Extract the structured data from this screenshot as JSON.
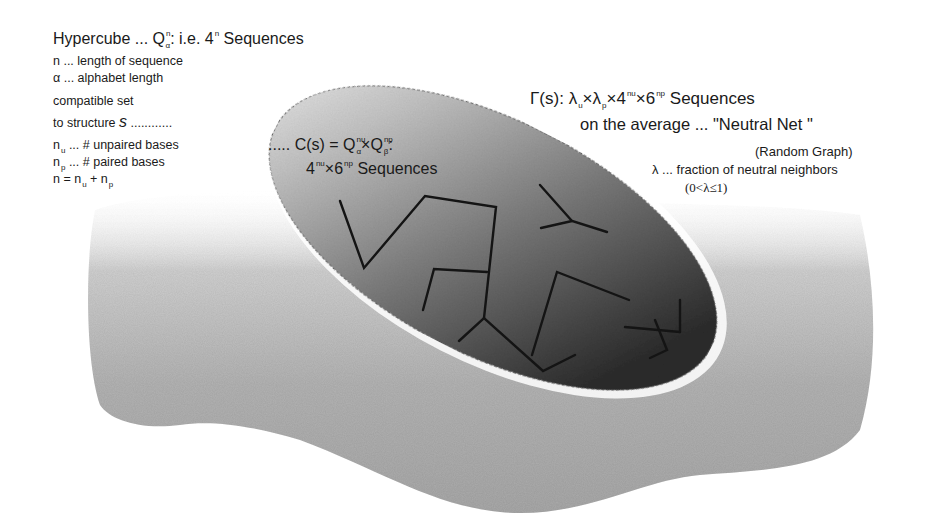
{
  "diagram": {
    "hypercube": {
      "prefix": "Hypercube ... Q",
      "q_sup": "n",
      "q_sub": "α",
      "suffix": ": i.e. 4",
      "four_sup": "n",
      "tail": " Sequences"
    },
    "definitions": [
      {
        "text": "n ... length of sequence"
      },
      {
        "text": "α ... alphabet length"
      }
    ],
    "compatible_set": {
      "line1": "compatible set",
      "line2_prefix": "to structure ",
      "line2_var": "s",
      "line2_dots": " ............"
    },
    "base_definitions": {
      "unpaired": {
        "n": "n",
        "sub": "u",
        "text": " ... # unpaired bases"
      },
      "paired": {
        "n": "n",
        "sub": "p",
        "text": " ... # paired bases"
      },
      "sum": {
        "lhs": "n = n",
        "sub1": "u",
        "plus": " + n",
        "sub2": "p"
      }
    },
    "cs_label": {
      "prefix": "..... C(s) = Q",
      "sup1": "nu",
      "sub1": "α",
      "times": "×Q",
      "sup2": "np",
      "sub2": "β",
      "colon": ":",
      "line2_four": "4",
      "line2_sup1": "nu",
      "line2_times": "×6",
      "line2_sup2": "np",
      "line2_tail": " Sequences"
    },
    "gamma_label": {
      "prefix": "Γ(s): λ",
      "sub1": "u",
      "times1": "×λ",
      "sub2": "p",
      "times2": "×4",
      "sup1": "nu",
      "times3": "×6",
      "sup2": "np",
      "tail": " Sequences",
      "line2": "on the average ... \"Neutral Net \"",
      "line3": "(Random Graph)",
      "line4": "λ ... fraction of neutral neighbors",
      "line5": "(0<λ≤1)"
    },
    "colors": {
      "blob": "#b5b5b5",
      "ellipse_light": "#d8d8d8",
      "ellipse_dark": "#3a3a3a",
      "edges": "#141414"
    },
    "graph_edges": [
      [
        [
          340,
          201
        ],
        [
          364,
          268
        ],
        [
          425,
          196
        ],
        [
          496,
          207
        ],
        [
          484,
          318
        ]
      ],
      [
        [
          423,
          310
        ],
        [
          434,
          269
        ],
        [
          487,
          272
        ]
      ],
      [
        [
          459,
          341
        ],
        [
          484,
          318
        ],
        [
          543,
          371
        ],
        [
          575,
          355
        ]
      ],
      [
        [
          532,
          355
        ],
        [
          557,
          272
        ],
        [
          629,
          300
        ]
      ],
      [
        [
          540,
          185
        ],
        [
          572,
          221
        ],
        [
          607,
          232
        ]
      ],
      [
        [
          541,
          228
        ],
        [
          572,
          221
        ]
      ],
      [
        [
          680,
          300
        ],
        [
          680,
          332
        ]
      ],
      [
        [
          625,
          327
        ],
        [
          680,
          332
        ]
      ],
      [
        [
          655,
          320
        ],
        [
          667,
          350
        ],
        [
          650,
          358
        ]
      ]
    ]
  }
}
